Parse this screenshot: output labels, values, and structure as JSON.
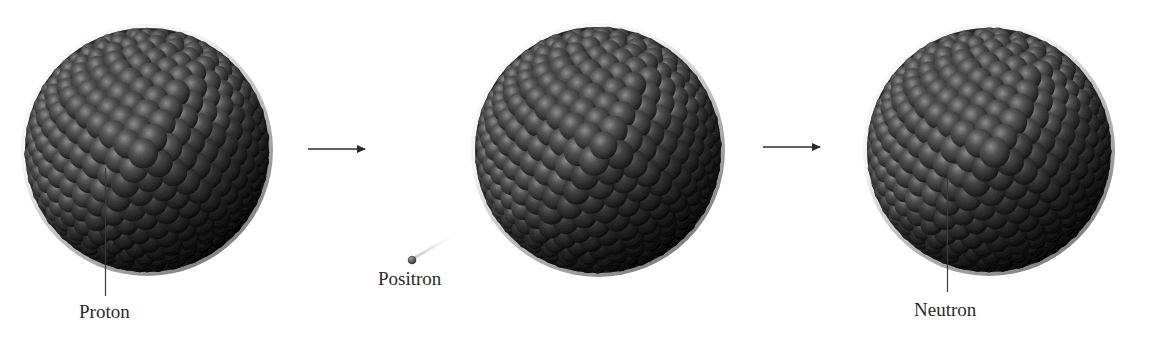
{
  "diagram": {
    "title": "",
    "stages": [
      {
        "id": "nucleus-before",
        "cx": 147,
        "cy": 150,
        "r": 126
      },
      {
        "id": "nucleus-middle",
        "cx": 598,
        "cy": 150,
        "r": 127
      },
      {
        "id": "nucleus-after",
        "cx": 989,
        "cy": 150,
        "r": 126
      }
    ],
    "arrows": [
      {
        "id": "arrow-1",
        "x1": 308,
        "x2": 367,
        "y": 149
      },
      {
        "id": "arrow-2",
        "x1": 763,
        "x2": 822,
        "y": 147
      }
    ],
    "labels": {
      "proton": "Proton",
      "positron": "Positron",
      "neutron": "Neutron"
    },
    "colors": {
      "background": "#ffffff",
      "nucleon_base": "#4a4a4a",
      "nucleon_highlight": "#8a8a8a",
      "nucleon_shadow": "#262626",
      "leader_line": "#3a3a3a",
      "arrow": "#2a2a2a",
      "text": "#2a2a2a"
    }
  }
}
